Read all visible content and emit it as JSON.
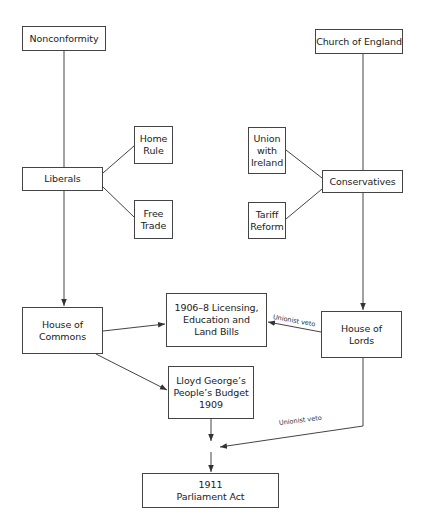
{
  "diagram": {
    "type": "flowchart",
    "colors": {
      "line": "#444444",
      "box_border": "#444444",
      "text": "#222222",
      "background": "#ffffff"
    },
    "nodes": {
      "nonconformity": {
        "label": "Nonconformity"
      },
      "church_of_england": {
        "label": "Church of England"
      },
      "home_rule": {
        "label": "Home\nRule"
      },
      "liberals": {
        "label": "Liberals"
      },
      "free_trade": {
        "label": "Free\nTrade"
      },
      "union_with_ireland": {
        "label": "Union\nwith\nIreland"
      },
      "conservatives": {
        "label": "Conservatives"
      },
      "tariff_reform": {
        "label": "Tariff\nReform"
      },
      "house_of_commons": {
        "label": "House of\nCommons"
      },
      "bills_1906_8": {
        "label": "1906–8 Licensing,\nEducation and\nLand Bills"
      },
      "house_of_lords": {
        "label": "House of\nLords"
      },
      "peoples_budget": {
        "label": "Lloyd George’s\nPeople’s Budget\n1909"
      },
      "parliament_act": {
        "label": "1911\nParliament Act"
      }
    },
    "edge_labels": {
      "veto_bills": "Unionist veto",
      "veto_budget": "Unionist veto"
    },
    "edges": [
      {
        "from": "Nonconformity",
        "to": "Liberals",
        "arrow": false
      },
      {
        "from": "Liberals",
        "to": "Home Rule",
        "arrow": false
      },
      {
        "from": "Liberals",
        "to": "Free Trade",
        "arrow": false
      },
      {
        "from": "Liberals",
        "to": "House of Commons",
        "arrow": true
      },
      {
        "from": "Church of England",
        "to": "Conservatives",
        "arrow": false
      },
      {
        "from": "Conservatives",
        "to": "Union with Ireland",
        "arrow": false
      },
      {
        "from": "Conservatives",
        "to": "Tariff Reform",
        "arrow": false
      },
      {
        "from": "Conservatives",
        "to": "House of Lords",
        "arrow": true
      },
      {
        "from": "House of Commons",
        "to": "1906–8 Licensing, Education and Land Bills",
        "arrow": true
      },
      {
        "from": "House of Commons",
        "to": "Lloyd George’s People’s Budget 1909",
        "arrow": true
      },
      {
        "from": "House of Lords",
        "to": "1906–8 Licensing, Education and Land Bills",
        "arrow": true,
        "label": "Unionist veto"
      },
      {
        "from": "House of Lords",
        "to": "junction",
        "arrow": true,
        "label": "Unionist veto"
      },
      {
        "from": "Lloyd George’s People’s Budget 1909",
        "to": "junction",
        "arrow": true
      },
      {
        "from": "junction",
        "to": "1911 Parliament Act",
        "arrow": true
      }
    ]
  }
}
